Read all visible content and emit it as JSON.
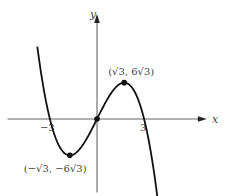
{
  "chart_data": {
    "type": "line",
    "title": "",
    "function": "y = 9x - x^3",
    "xlabel": "x",
    "ylabel": "y",
    "xlim": [
      -5.7,
      7
    ],
    "ylim": [
      -21,
      30
    ],
    "curve_domain": [
      -3.8,
      3.9
    ],
    "grid": false,
    "x_ticks": [
      {
        "value": -3,
        "label": "−3"
      },
      {
        "value": 3,
        "label": "3"
      }
    ],
    "series": [
      {
        "name": "y = 9x - x^3",
        "color": "#111111",
        "x": [
          -3.8,
          -3,
          -1.732,
          0,
          1.732,
          3,
          3.9
        ],
        "y": [
          20.67,
          0,
          -10.39,
          0,
          10.39,
          0,
          -24.22
        ]
      }
    ],
    "points": [
      {
        "x": -1.732,
        "y": -10.392,
        "label": "(−√3, −6√3)"
      },
      {
        "x": 0,
        "y": 0,
        "label": ""
      },
      {
        "x": 1.732,
        "y": 10.392,
        "label": "(√3, 6√3)"
      }
    ],
    "axis_color": "#666666",
    "curve_color": "#111111"
  }
}
